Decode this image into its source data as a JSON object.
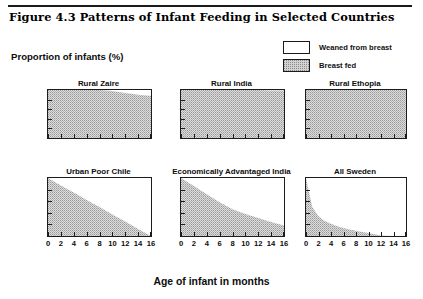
{
  "figure": {
    "title": "Figure 4.3  Patterns of Infant Feeding in Selected Countries",
    "y_caption": "Proportion  of infants (%)",
    "x_caption": "Age of infant in months"
  },
  "legend": {
    "items": [
      {
        "label": "Weaned from breast",
        "swatch": "white-box",
        "color": "#ffffff"
      },
      {
        "label": "Breast fed",
        "swatch": "stippled-box",
        "color": "#d2d2d2"
      }
    ]
  },
  "axes": {
    "x_tick_labels": [
      "0",
      "2",
      "4",
      "6",
      "8",
      "10",
      "12",
      "14",
      "16"
    ],
    "x_tick_values": [
      0,
      2,
      4,
      6,
      8,
      10,
      12,
      14,
      16
    ],
    "xlim": [
      0,
      16
    ],
    "ylim": [
      0,
      100
    ],
    "y_tick_count": 5,
    "y_tick_labels": []
  },
  "chart_data": [
    {
      "type": "area",
      "title": "Rural Zaire",
      "xlabel": "Age of infant in months",
      "ylabel": "Proportion of infants (%)",
      "xlim": [
        0,
        16
      ],
      "ylim": [
        0,
        100
      ],
      "grid": false,
      "series": [
        {
          "name": "Breast fed",
          "x": [
            0,
            2,
            4,
            6,
            8,
            9,
            10,
            11,
            12,
            13,
            14,
            15,
            16
          ],
          "values": [
            100,
            100,
            100,
            100,
            100,
            99,
            98,
            96,
            94,
            92,
            90,
            89,
            88
          ]
        }
      ]
    },
    {
      "type": "area",
      "title": "Rural India",
      "xlabel": "Age of infant in months",
      "ylabel": "Proportion of infants (%)",
      "xlim": [
        0,
        16
      ],
      "ylim": [
        0,
        100
      ],
      "grid": false,
      "series": [
        {
          "name": "Breast fed",
          "x": [
            0,
            2,
            4,
            6,
            8,
            10,
            12,
            14,
            16
          ],
          "values": [
            100,
            100,
            100,
            100,
            100,
            100,
            100,
            99,
            99
          ]
        }
      ]
    },
    {
      "type": "area",
      "title": "Rural Ethopia",
      "xlabel": "Age of infant in months",
      "ylabel": "Proportion of infants (%)",
      "xlim": [
        0,
        16
      ],
      "ylim": [
        0,
        100
      ],
      "grid": false,
      "series": [
        {
          "name": "Breast fed",
          "x": [
            0,
            2,
            4,
            6,
            8,
            10,
            12,
            14,
            16
          ],
          "values": [
            100,
            100,
            100,
            100,
            100,
            100,
            100,
            100,
            100
          ]
        }
      ]
    },
    {
      "type": "area",
      "title": "Urban Poor Chile",
      "xlabel": "Age of infant in months",
      "ylabel": "Proportion of infants (%)",
      "xlim": [
        0,
        16
      ],
      "ylim": [
        0,
        100
      ],
      "grid": false,
      "series": [
        {
          "name": "Breast fed",
          "x": [
            0,
            2,
            4,
            6,
            8,
            10,
            12,
            14,
            16
          ],
          "values": [
            100,
            87,
            75,
            62,
            50,
            37,
            25,
            12,
            0
          ]
        }
      ]
    },
    {
      "type": "area",
      "title": "Economically Advantaged India",
      "xlabel": "Age of infant in months",
      "ylabel": "Proportion of infants (%)",
      "xlim": [
        0,
        16
      ],
      "ylim": [
        0,
        100
      ],
      "grid": false,
      "series": [
        {
          "name": "Breast fed",
          "x": [
            0,
            2,
            4,
            6,
            8,
            10,
            12,
            14,
            16
          ],
          "values": [
            100,
            86,
            72,
            58,
            46,
            38,
            31,
            24,
            18
          ]
        }
      ]
    },
    {
      "type": "area",
      "title": "All Sweden",
      "xlabel": "Age of infant in months",
      "ylabel": "Proportion of infants (%)",
      "xlim": [
        0,
        16
      ],
      "ylim": [
        0,
        100
      ],
      "grid": false,
      "series": [
        {
          "name": "Breast fed",
          "x": [
            0,
            1,
            2,
            3,
            4,
            5,
            6,
            7,
            8,
            9,
            10,
            11,
            12,
            14,
            16
          ],
          "values": [
            100,
            50,
            34,
            26,
            21,
            17,
            14,
            11,
            9,
            7,
            5,
            3,
            1,
            0,
            0
          ]
        }
      ]
    }
  ]
}
